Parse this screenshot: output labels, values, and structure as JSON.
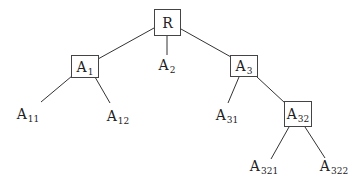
{
  "tree": {
    "nodes": [
      {
        "id": "R",
        "base": "R",
        "sub": "",
        "boxed": true,
        "x": 154,
        "y": 9,
        "w": 27,
        "h": 27
      },
      {
        "id": "A1",
        "base": "A",
        "sub": "1",
        "boxed": true,
        "x": 71,
        "y": 55,
        "w": 28,
        "h": 23
      },
      {
        "id": "A2",
        "base": "A",
        "sub": "2",
        "boxed": false,
        "x": 156,
        "y": 56,
        "w": 22,
        "h": 18
      },
      {
        "id": "A3",
        "base": "A",
        "sub": "3",
        "boxed": true,
        "x": 230,
        "y": 55,
        "w": 28,
        "h": 22
      },
      {
        "id": "A11",
        "base": "A",
        "sub": "11",
        "boxed": false,
        "x": 14,
        "y": 105,
        "w": 28,
        "h": 18
      },
      {
        "id": "A12",
        "base": "A",
        "sub": "12",
        "boxed": false,
        "x": 104,
        "y": 107,
        "w": 28,
        "h": 18
      },
      {
        "id": "A31",
        "base": "A",
        "sub": "31",
        "boxed": false,
        "x": 213,
        "y": 106,
        "w": 28,
        "h": 18
      },
      {
        "id": "A32",
        "base": "A",
        "sub": "32",
        "boxed": true,
        "x": 284,
        "y": 101,
        "w": 28,
        "h": 26
      },
      {
        "id": "A321",
        "base": "A",
        "sub": "321",
        "boxed": false,
        "x": 248,
        "y": 156,
        "w": 32,
        "h": 20
      },
      {
        "id": "A322",
        "base": "A",
        "sub": "322",
        "boxed": false,
        "x": 318,
        "y": 156,
        "w": 32,
        "h": 20
      }
    ],
    "edges": [
      {
        "from": "R",
        "to": "A1",
        "x1": 154,
        "y1": 28,
        "x2": 98,
        "y2": 59
      },
      {
        "from": "R",
        "to": "A2",
        "x1": 167,
        "y1": 36,
        "x2": 167,
        "y2": 55
      },
      {
        "from": "R",
        "to": "A3",
        "x1": 181,
        "y1": 29,
        "x2": 231,
        "y2": 57
      },
      {
        "from": "A1",
        "to": "A11",
        "x1": 72,
        "y1": 76,
        "x2": 41,
        "y2": 102
      },
      {
        "from": "A1",
        "to": "A12",
        "x1": 95,
        "y1": 77,
        "x2": 110,
        "y2": 103
      },
      {
        "from": "A3",
        "to": "A31",
        "x1": 239,
        "y1": 77,
        "x2": 228,
        "y2": 103
      },
      {
        "from": "A3",
        "to": "A32",
        "x1": 257,
        "y1": 77,
        "x2": 285,
        "y2": 103
      },
      {
        "from": "A32",
        "to": "A321",
        "x1": 289,
        "y1": 127,
        "x2": 271,
        "y2": 159
      },
      {
        "from": "A32",
        "to": "A322",
        "x1": 305,
        "y1": 127,
        "x2": 325,
        "y2": 158
      }
    ]
  }
}
